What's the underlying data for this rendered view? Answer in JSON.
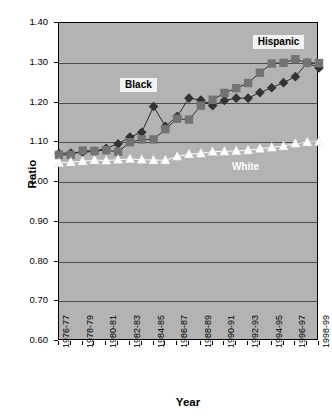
{
  "chart_data": {
    "type": "line",
    "title": "",
    "subtitle": "",
    "xlabel": "Year",
    "ylabel": "Ratio",
    "ylim": [
      0.6,
      1.4
    ],
    "ytick_step": 0.1,
    "yticks": [
      "1.40",
      "1.30",
      "1.20",
      "1.10",
      "1.00",
      "0.90",
      "0.80",
      "0.70",
      "0.60"
    ],
    "ytick_values": [
      1.4,
      1.3,
      1.2,
      1.1,
      1.0,
      0.9,
      0.8,
      0.7,
      0.6
    ],
    "grid": true,
    "grid_axis": "y",
    "legend_position": "inline-annotations",
    "plot_background": "#b3b3b3",
    "x": [
      "1976-77",
      "1977-78",
      "1978-79",
      "1979-80",
      "1980-81",
      "1981-82",
      "1982-83",
      "1983-84",
      "1984-85",
      "1985-86",
      "1986-87",
      "1987-88",
      "1988-89",
      "1989-90",
      "1990-91",
      "1991-92",
      "1992-93",
      "1993-94",
      "1994-95",
      "1995-96",
      "1996-97",
      "1997-98",
      "1998-99"
    ],
    "xtick_labels": [
      "1976-77",
      "1978-79",
      "1980-81",
      "1982-83",
      "1984-85",
      "1986-87",
      "1988-89",
      "1990-91",
      "1992-93",
      "1994-95",
      "1996-97",
      "1998-99"
    ],
    "xtick_label_indices": [
      0,
      2,
      4,
      6,
      8,
      10,
      12,
      14,
      16,
      18,
      20,
      22
    ],
    "series": [
      {
        "name": "Black",
        "marker": "diamond",
        "color": "#333333",
        "label_style": "boxed",
        "values": [
          1.072,
          1.073,
          1.075,
          1.077,
          1.085,
          1.096,
          1.113,
          1.125,
          1.19,
          1.14,
          1.165,
          1.211,
          1.206,
          1.192,
          1.205,
          1.211,
          1.211,
          1.225,
          1.237,
          1.25,
          1.265,
          1.3,
          1.287
        ]
      },
      {
        "name": "Hispanic",
        "marker": "square",
        "color": "#737373",
        "label_style": "boxed",
        "values": [
          1.068,
          1.068,
          1.079,
          1.078,
          1.08,
          1.076,
          1.1,
          1.107,
          1.107,
          1.133,
          1.159,
          1.157,
          1.192,
          1.207,
          1.224,
          1.236,
          1.249,
          1.275,
          1.298,
          1.3,
          1.309,
          1.3,
          1.299
        ]
      },
      {
        "name": "White",
        "marker": "triangle",
        "color": "#ffffff",
        "label_style": "plain",
        "values": [
          1.048,
          1.05,
          1.052,
          1.055,
          1.054,
          1.056,
          1.058,
          1.056,
          1.055,
          1.055,
          1.064,
          1.07,
          1.072,
          1.076,
          1.077,
          1.078,
          1.08,
          1.084,
          1.087,
          1.09,
          1.097,
          1.1,
          1.101
        ]
      }
    ],
    "annotations": [
      {
        "text": "Black",
        "x_pct": 0.235,
        "y_val": 1.243,
        "style": "boxed"
      },
      {
        "text": "Hispanic",
        "x_pct": 0.745,
        "y_val": 1.352,
        "style": "boxed"
      },
      {
        "text": "White",
        "x_pct": 0.665,
        "y_val": 1.032,
        "style": "plain"
      }
    ]
  }
}
